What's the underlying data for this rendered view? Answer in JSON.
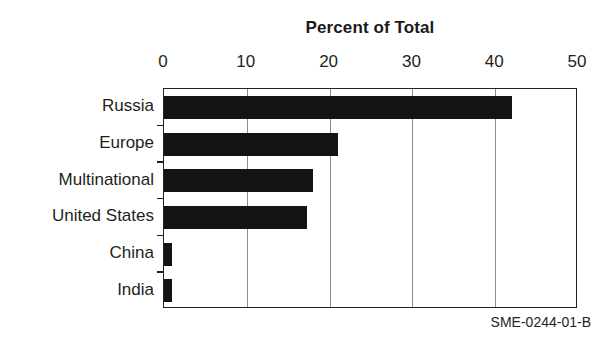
{
  "chart_data": {
    "type": "bar",
    "orientation": "horizontal",
    "title": "Percent of Total",
    "xlabel": "",
    "ylabel": "",
    "categories": [
      "Russia",
      "Europe",
      "Multinational",
      "United States",
      "China",
      "India"
    ],
    "values": [
      42,
      21,
      18,
      17.3,
      1,
      1
    ],
    "series": [
      {
        "name": "Percent of Total",
        "values": [
          42,
          21,
          18,
          17.3,
          1,
          1
        ]
      }
    ],
    "xlim": [
      0,
      50
    ],
    "xticks": [
      0,
      10,
      20,
      30,
      40,
      50
    ],
    "xtick_labels": [
      "0",
      "10",
      "20",
      "30",
      "40",
      "50"
    ],
    "grid": "vertical",
    "legend": "none",
    "bar_color": "#141414",
    "axis_color": "#231f20",
    "gridline_color": "#8d8d8d"
  },
  "figure": {
    "source_code": "SME-0244-01-B"
  }
}
